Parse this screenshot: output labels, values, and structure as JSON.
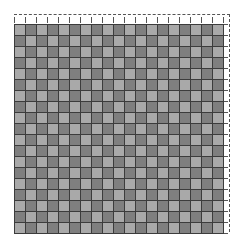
{
  "figure": {
    "type": "checkerboard-grid",
    "rows": 19,
    "cols": 19,
    "first_cell": "light",
    "colors": {
      "light": "#a9a9a9",
      "dark": "#7f7f7f",
      "gridline": "#3c3c3c",
      "dashed_outline": "#555555",
      "background": "#ffffff"
    },
    "outline": {
      "style": "dashed",
      "edges": [
        "top",
        "right"
      ]
    }
  }
}
